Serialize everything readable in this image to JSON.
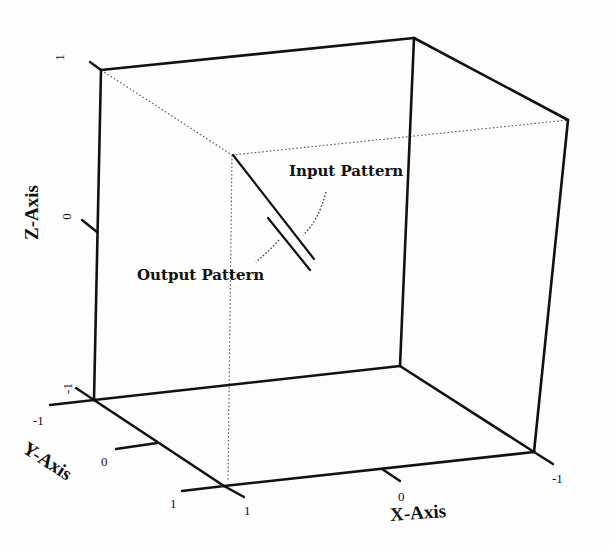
{
  "figure": {
    "type": "3d-bounding-cube",
    "annotations": {
      "input_pattern": "Input Pattern",
      "output_pattern": "Output Pattern"
    },
    "axes": {
      "x": {
        "title": "X-Axis",
        "ticks": [
          "0",
          "-1",
          "1"
        ]
      },
      "y": {
        "title": "Y-Axis",
        "ticks": [
          "-1",
          "0",
          "1"
        ]
      },
      "z": {
        "title": "Z-Axis",
        "ticks": [
          "1",
          "0",
          "-1"
        ]
      }
    },
    "tick_labels": {
      "z_top": "1",
      "z_mid": "0",
      "z_bottom": "-1",
      "y_neg": "-1",
      "y_zero": "0",
      "y_pos": "1",
      "x_pos": "1",
      "x_zero": "0",
      "x_neg": "-1"
    },
    "colors": {
      "line": "#111111",
      "background": "#fdfdfd",
      "hidden_line": "#555555"
    }
  }
}
